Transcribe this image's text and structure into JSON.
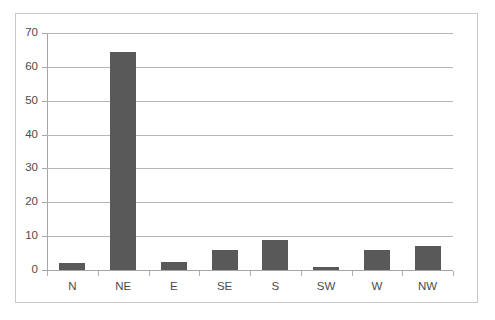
{
  "chart_data": {
    "type": "bar",
    "title": "",
    "subtitle": "",
    "xlabel": "",
    "ylabel": "",
    "categories": [
      "N",
      "NE",
      "E",
      "SE",
      "S",
      "SW",
      "W",
      "NW"
    ],
    "values": [
      2,
      64.5,
      2.5,
      6,
      9,
      1,
      6,
      7
    ],
    "series": [
      {
        "name": "",
        "values": [
          2,
          64.5,
          2.5,
          6,
          9,
          1,
          6,
          7
        ],
        "color": "#595959"
      }
    ],
    "ylim": [
      0,
      70
    ],
    "ytick_step": 10,
    "yticks": [
      0,
      10,
      20,
      30,
      40,
      50,
      60,
      70
    ],
    "ytick_labels": [
      "0",
      "10",
      "20",
      "30",
      "40",
      "50",
      "60",
      "70"
    ],
    "grid": {
      "horizontal": true,
      "vertical": false,
      "color": "#b6b6b6"
    },
    "legend": {
      "visible": false,
      "position": "none",
      "entries": []
    },
    "annotations": [],
    "plot_background": "#ffffff",
    "frame_border_color": "#c9c9c9",
    "axis_line_color": "#a6a6a6",
    "tick_label_color": "#4b4b4b"
  }
}
